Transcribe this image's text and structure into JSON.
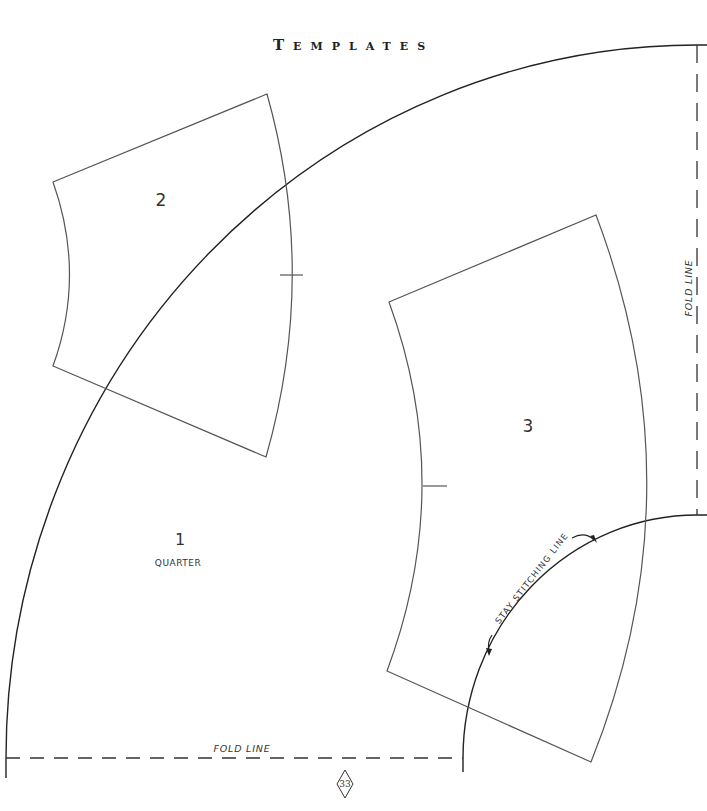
{
  "page": {
    "title": "Templates",
    "page_number": "33"
  },
  "quarter": {
    "number": "1",
    "label": "QUARTER"
  },
  "template_2": {
    "number": "2"
  },
  "template_3": {
    "number": "3"
  },
  "fold_lines": {
    "horizontal_label": "FOLD LINE",
    "vertical_label": "FOLD LINE"
  },
  "stitching": {
    "label": "STAY STITCHING LINE"
  },
  "colors": {
    "ink": "#222222",
    "template_line": "#555555",
    "paper": "#ffffff"
  }
}
